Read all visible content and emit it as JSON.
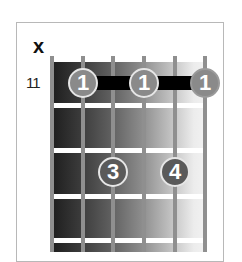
{
  "diagram": {
    "type": "guitar-chord-diagram",
    "muted_string_marker": "x",
    "start_fret_label": "11",
    "strings": 6,
    "frets_shown": 4,
    "barre": {
      "finger": "1",
      "fret_row": 1,
      "from_string": 2,
      "to_string": 6
    },
    "fingers": [
      {
        "label": "1",
        "string": 2,
        "fret_row": 1
      },
      {
        "label": "1",
        "string": 4,
        "fret_row": 1
      },
      {
        "label": "1",
        "string": 6,
        "fret_row": 1
      },
      {
        "label": "3",
        "string": 3,
        "fret_row": 3
      },
      {
        "label": "4",
        "string": 5,
        "fret_row": 3
      }
    ],
    "colors": {
      "barre": "#000000",
      "finger_dot": "#8a8a8a",
      "finger_text": "#ffffff",
      "string": "#8f8f8f",
      "fret": "#ffffff",
      "frame_border": "#b8b8b8"
    }
  }
}
